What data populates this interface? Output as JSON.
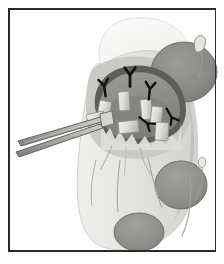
{
  "figure": {
    "domain_kind": "surgical-anatomical-illustration",
    "title": "",
    "caption": "",
    "background_color": "#ffffff",
    "frame": {
      "name": "figure-border",
      "color": "#2b2b2b",
      "line_width_px": 1.5,
      "left": 8,
      "top": 8,
      "width": 208,
      "height": 243
    },
    "palette": {
      "paper_white": "#ffffff",
      "skin_pale": "#f2f2f0",
      "skin_light_gray": "#d9d9d6",
      "tissue_mid_gray": "#b0b0ad",
      "wound_bed_gray": "#8e8e8b",
      "wound_rim_dark": "#5e5e5c",
      "mass_dark_gray": "#868683",
      "mass_outline": "#6e6e6c",
      "clip_highlight": "#e8e8e5",
      "suture_black": "#111111",
      "instrument_gray": "#9a9a97",
      "instrument_outline": "#4a4a48",
      "vessel_line": "#9c9c99"
    },
    "regions": [
      {
        "name": "upper-pale-lobe",
        "label": "pale proximal soft tissue lobe",
        "shade": "#f4f4f2"
      },
      {
        "name": "limb-body",
        "label": "limb / foot silhouette",
        "shade": "#e6e6e3"
      },
      {
        "name": "mid-gray-band",
        "label": "deep tissue plane",
        "shade": "#c8c8c5"
      },
      {
        "name": "wound-cavity",
        "label": "open surgical wound cavity",
        "shade": "#8e8e8b"
      },
      {
        "name": "wound-rim",
        "label": "wound margin / incised edge",
        "shade": "#5e5e5c"
      }
    ],
    "masses": [
      {
        "name": "mass-upper-right",
        "label": "rounded mass, upper right",
        "cx": 184,
        "cy": 72,
        "rx": 33,
        "ry": 30,
        "shade": "#868683"
      },
      {
        "name": "mass-lower-right",
        "label": "ovoid mass, lower right",
        "cx": 181,
        "cy": 185,
        "rx": 26,
        "ry": 24,
        "shade": "#8b8b88"
      },
      {
        "name": "mass-bottom",
        "label": "ovoid mass, bottom center",
        "cx": 139,
        "cy": 232,
        "rx": 25,
        "ry": 19,
        "shade": "#8e8e8b"
      }
    ],
    "clips": [
      {
        "name": "clip-1",
        "label": "tissue clip / stay suture tab",
        "x": 118,
        "y": 92,
        "w": 11,
        "h": 19,
        "rot": -4
      },
      {
        "name": "clip-2",
        "label": "tissue clip / stay suture tab",
        "x": 100,
        "y": 100,
        "w": 12,
        "h": 18,
        "rot": 10
      },
      {
        "name": "clip-3",
        "label": "tissue clip / stay suture tab",
        "x": 140,
        "y": 100,
        "w": 11,
        "h": 20,
        "rot": -6
      },
      {
        "name": "clip-4",
        "label": "tissue clip / stay suture tab",
        "x": 152,
        "y": 106,
        "w": 11,
        "h": 19,
        "rot": 6
      },
      {
        "name": "clip-5",
        "label": "tissue clip / stay suture tab",
        "x": 86,
        "y": 115,
        "w": 18,
        "h": 13,
        "rot": -14
      },
      {
        "name": "clip-6",
        "label": "tissue clip / stay suture tab",
        "x": 118,
        "y": 122,
        "w": 20,
        "h": 12,
        "rot": -6
      },
      {
        "name": "clip-7",
        "label": "tissue clip / stay suture tab",
        "x": 156,
        "y": 122,
        "w": 13,
        "h": 18,
        "rot": 4
      }
    ],
    "suture_marks": [
      {
        "name": "suture-mark-1",
        "label": "Y-shaped suture tail",
        "x": 130,
        "y": 74,
        "rot": 0,
        "scale": 1.05
      },
      {
        "name": "suture-mark-2",
        "label": "Y-shaped suture tail",
        "x": 104,
        "y": 85,
        "rot": -8,
        "scale": 0.95
      },
      {
        "name": "suture-mark-3",
        "label": "Y-shaped suture tail",
        "x": 150,
        "y": 88,
        "rot": 6,
        "scale": 0.95
      },
      {
        "name": "suture-mark-4",
        "label": "arrowed suture tail",
        "x": 148,
        "y": 124,
        "rot": 128,
        "scale": 0.9
      },
      {
        "name": "suture-mark-5",
        "label": "arrowed suture tail",
        "x": 172,
        "y": 118,
        "rot": 150,
        "scale": 0.9
      }
    ],
    "instrument": {
      "name": "surgical-forceps",
      "label": "long fine-tipped surgical forceps entering wound from lower left",
      "tip_x": 106,
      "tip_y": 120,
      "handle_x": 18,
      "handle_y": 147,
      "jaw_count": 2
    },
    "hook": {
      "name": "tissue-hook-loop",
      "label": "small loop / hook at upper right of mass",
      "x": 196,
      "y": 40,
      "w": 8,
      "h": 14
    },
    "vessels": [
      {
        "name": "vessel-1",
        "label": "superficial vessel",
        "path_hint": "mid-lower limb, vertical"
      },
      {
        "name": "vessel-2",
        "label": "superficial vessel",
        "path_hint": "lower right, curving"
      },
      {
        "name": "vessel-3",
        "label": "superficial vessel",
        "path_hint": "right margin, long"
      }
    ]
  }
}
